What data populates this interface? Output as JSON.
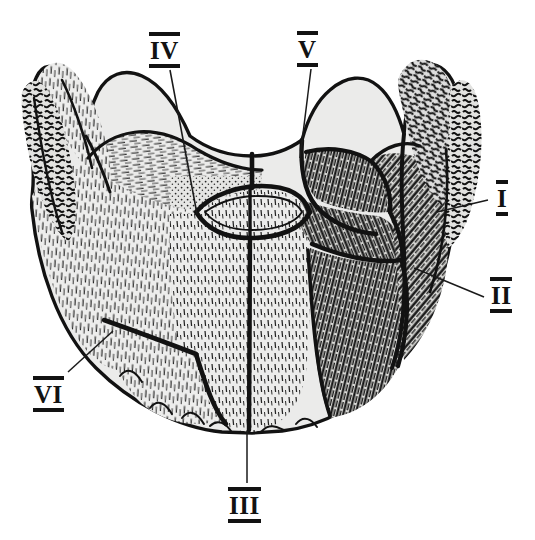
{
  "figure": {
    "kind": "anatomical-line-drawing",
    "background_color": "#ffffff",
    "ink_color": "#121212",
    "bone_fill_color": "#e8e8e6",
    "shaded_fill_color": "#b9b9b6"
  },
  "labels": [
    {
      "id": "I",
      "text": "I",
      "x": 496,
      "y": 180,
      "leader": {
        "from": [
          488,
          200
        ],
        "to": [
          437,
          212
        ]
      }
    },
    {
      "id": "II",
      "text": "II",
      "x": 490,
      "y": 277,
      "leader": {
        "from": [
          484,
          297
        ],
        "to": [
          414,
          268
        ]
      }
    },
    {
      "id": "III",
      "text": "III",
      "x": 228,
      "y": 487,
      "leader": {
        "from": [
          247,
          483
        ],
        "to": [
          247,
          431
        ]
      }
    },
    {
      "id": "IV",
      "text": "IV",
      "x": 149,
      "y": 32,
      "leader": {
        "from": [
          170,
          70
        ],
        "to": [
          197,
          214
        ]
      }
    },
    {
      "id": "V",
      "text": "V",
      "x": 297,
      "y": 31,
      "leader": {
        "from": [
          311,
          69
        ],
        "to": [
          300,
          158
        ]
      }
    },
    {
      "id": "VI",
      "text": "VI",
      "x": 33,
      "y": 376,
      "leader": {
        "from": [
          68,
          372
        ],
        "to": [
          113,
          331
        ]
      }
    }
  ],
  "label_style": {
    "overline": true,
    "underline": true,
    "bold": true
  },
  "regions": [
    {
      "name": "left-coronoid-process",
      "shading": "light"
    },
    {
      "name": "left-body-of-mandible",
      "shading": "light"
    },
    {
      "name": "mental-protuberance",
      "shading": "light"
    },
    {
      "name": "symphysis-midline-suture",
      "shading": "line"
    },
    {
      "name": "central-lens-foramen",
      "shading": "light"
    },
    {
      "name": "right-fragment-upper",
      "shading": "dark"
    },
    {
      "name": "right-fragment-middle",
      "shading": "dark"
    },
    {
      "name": "right-fragment-lower",
      "shading": "dark"
    },
    {
      "name": "right-coronoid-process",
      "shading": "dark"
    },
    {
      "name": "lower-left-suture-fragment",
      "shading": "light"
    }
  ]
}
